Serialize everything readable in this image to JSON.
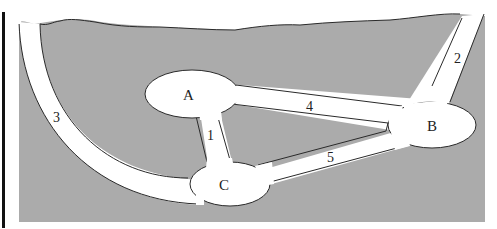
{
  "diagram": {
    "type": "tunnel-network",
    "colors": {
      "ground": "#ababab",
      "tunnel": "#ffffff",
      "outline": "#2a2a2a",
      "frame_bar": "#111111"
    },
    "chambers": [
      {
        "id": "A",
        "label": "A"
      },
      {
        "id": "B",
        "label": "B"
      },
      {
        "id": "C",
        "label": "C"
      }
    ],
    "tunnels": [
      {
        "id": "1",
        "label": "1",
        "from": "A",
        "to": "C"
      },
      {
        "id": "2",
        "label": "2",
        "from": "surface",
        "to": "B"
      },
      {
        "id": "3",
        "label": "3",
        "from": "surface",
        "to": "C"
      },
      {
        "id": "4",
        "label": "4",
        "from": "A",
        "to": "B"
      },
      {
        "id": "5",
        "label": "5",
        "from": "C",
        "to": "B"
      }
    ]
  }
}
